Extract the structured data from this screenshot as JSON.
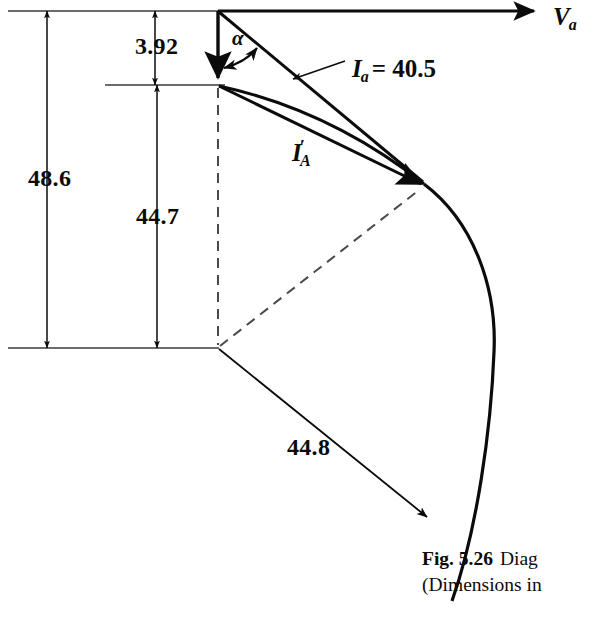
{
  "figure": {
    "axis_label": {
      "symbol": "V",
      "subscript": "a"
    },
    "angle_label": "α",
    "vector_current": {
      "symbol": "I",
      "subscript": "a",
      "equals": "= 40.5",
      "value": 40.5
    },
    "vector_current_prime": {
      "symbol": "I",
      "prime": "′",
      "subscript": "A"
    },
    "dimensions": [
      {
        "name": "total-vertical",
        "value": "48.6"
      },
      {
        "name": "top-offset",
        "value": "3.92"
      },
      {
        "name": "lower-vertical",
        "value": "44.7"
      },
      {
        "name": "arc-radius",
        "value": "44.8"
      }
    ],
    "caption": {
      "number": "Fig. 5.26",
      "text": "Diag",
      "second_line": "(Dimensions in"
    },
    "colors": {
      "ink": "#0b0b0b",
      "thin_rule": "#3a3a3a",
      "background": "#ffffff"
    }
  }
}
